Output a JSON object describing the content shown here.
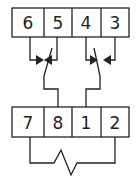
{
  "diagram": {
    "type": "connector-switch-wiring",
    "top_connector": {
      "pins": [
        "6",
        "5",
        "4",
        "3"
      ]
    },
    "bottom_connector": {
      "pins": [
        "7",
        "8",
        "1",
        "2"
      ]
    },
    "switches": [
      {
        "name": "left-switch",
        "between_pins": [
          "6",
          "5"
        ],
        "common_to_pin": "8"
      },
      {
        "name": "right-switch",
        "between_pins": [
          "4",
          "3"
        ],
        "common_to_pin": "1"
      }
    ],
    "resistor": {
      "between_pins": [
        "7",
        "2"
      ]
    },
    "colors": {
      "line": "#222222",
      "background": "#ffffff"
    }
  }
}
